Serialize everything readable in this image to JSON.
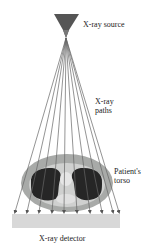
{
  "labels": {
    "source": "X-ray source",
    "paths_line1": "X-ray",
    "paths_line2": "paths",
    "torso_line1": "Patient's",
    "torso_line2": "torso",
    "detector": "X-ray detector"
  },
  "colors": {
    "source": "#555555",
    "rays": "#666666",
    "torso_outer": "#a8aaa8",
    "torso_inner": "#d4d4d4",
    "lungs": "#262626",
    "spine": "#e8e8e8",
    "detector": "#d8d8d8"
  },
  "ray_count": 10
}
